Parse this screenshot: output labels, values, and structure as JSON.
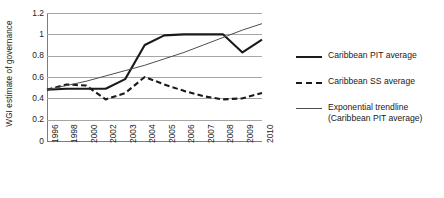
{
  "chart_data": {
    "type": "line",
    "title": "",
    "xlabel": "",
    "ylabel": "WGI estimate of governance",
    "categories": [
      "1996",
      "1998",
      "2000",
      "2002",
      "2003",
      "2004",
      "2005",
      "2006",
      "2007",
      "2008",
      "2009",
      "2010"
    ],
    "ylim": [
      0,
      1.2
    ],
    "yticks": [
      "0",
      "0.2",
      "0.4",
      "0.6",
      "0.8",
      "1",
      "1.2"
    ],
    "ytick_values": [
      0,
      0.2,
      0.4,
      0.6,
      0.8,
      1.0,
      1.2
    ],
    "grid": true,
    "legend_position": "right",
    "series": [
      {
        "name": "Caribbean PIT average",
        "style": "solid-thick",
        "color": "#1a1a1a",
        "values": [
          0.48,
          0.49,
          0.49,
          0.49,
          0.58,
          0.9,
          0.99,
          1.0,
          1.0,
          1.0,
          0.83,
          0.95
        ]
      },
      {
        "name": "Caribbean SS average",
        "style": "dashed-thick",
        "color": "#1a1a1a",
        "values": [
          0.48,
          0.53,
          0.52,
          0.39,
          0.45,
          0.6,
          0.53,
          0.47,
          0.42,
          0.39,
          0.4,
          0.45
        ]
      },
      {
        "name": "Exponential trendline (Caribbean PIT average)",
        "style": "solid-thin",
        "color": "#4d4d4d",
        "values": [
          0.48,
          0.52,
          0.56,
          0.61,
          0.66,
          0.71,
          0.77,
          0.83,
          0.9,
          0.97,
          1.04,
          1.1
        ]
      }
    ]
  },
  "legend": {
    "items": [
      {
        "label": "Caribbean PIT average",
        "swatch": "solid-thick"
      },
      {
        "label": "Caribbean SS average",
        "swatch": "dashed-thick"
      },
      {
        "label": "Exponential trendline\n(Caribbean PIT average)",
        "swatch": "solid-thin"
      }
    ]
  }
}
